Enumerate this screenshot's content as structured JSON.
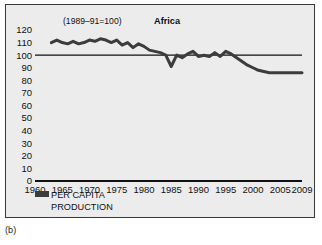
{
  "figure": {
    "caption": "(b)",
    "panel_title": "Africa",
    "index_note": "(1989–91=100)"
  },
  "legend": {
    "swatch_color": "#3c3c3c",
    "label_line1": "PER CAPITA",
    "label_line2": "PRODUCTION"
  },
  "chart_data": {
    "type": "line",
    "title": "Africa",
    "subtitle": "(1989–91=100)",
    "xlabel": "",
    "ylabel": "",
    "xlim": [
      1960,
      2009
    ],
    "ylim": [
      0,
      120
    ],
    "grid": false,
    "legend_position": "below-axis-left",
    "reference_line": {
      "y": 100,
      "label": "100",
      "color": "#111111"
    },
    "xticks": [
      1960,
      1965,
      1970,
      1975,
      1980,
      1985,
      1990,
      1995,
      2000,
      2005,
      2009
    ],
    "xtick_labels": [
      "1960",
      "1965",
      "1970",
      "1975",
      "1980",
      "1985",
      "1990",
      "1995",
      "2000",
      "2005",
      "2009"
    ],
    "yticks": [
      0,
      10,
      20,
      30,
      40,
      50,
      60,
      70,
      80,
      90,
      100,
      110,
      120
    ],
    "ytick_labels": [
      "0",
      "10",
      "20",
      "30",
      "40",
      "50",
      "60",
      "70",
      "80",
      "90",
      "100",
      "110",
      "120"
    ],
    "series": [
      {
        "name": "PER CAPITA PRODUCTION",
        "color": "#3c3c3c",
        "line_width": 3,
        "x": [
          1963,
          1964,
          1965,
          1966,
          1967,
          1968,
          1969,
          1970,
          1971,
          1972,
          1973,
          1974,
          1975,
          1976,
          1977,
          1978,
          1979,
          1980,
          1981,
          1982,
          1983,
          1984,
          1985,
          1986,
          1987,
          1988,
          1989,
          1990,
          1991,
          1992,
          1993,
          1994,
          1995,
          1996,
          1997,
          1998,
          1999,
          2000,
          2001,
          2002,
          2003,
          2004,
          2005,
          2006,
          2007,
          2008,
          2009
        ],
        "values": [
          110,
          112,
          110,
          109,
          111,
          109,
          110,
          112,
          111,
          113,
          112,
          110,
          112,
          108,
          110,
          106,
          109,
          107,
          104,
          103,
          102,
          100,
          91,
          100,
          98,
          101,
          103,
          99,
          100,
          99,
          102,
          99,
          103,
          101,
          98,
          95,
          92,
          90,
          88,
          87,
          86,
          86,
          86,
          86,
          86,
          86,
          86
        ]
      }
    ]
  }
}
